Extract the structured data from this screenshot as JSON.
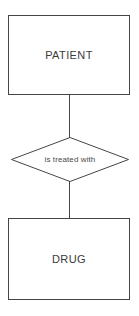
{
  "diagram": {
    "type": "entity-relationship-diagram",
    "entities": [
      {
        "id": "patient",
        "label": "PATIENT",
        "shape": "rectangle"
      },
      {
        "id": "drug",
        "label": "DRUG",
        "shape": "rectangle"
      }
    ],
    "relationship": {
      "id": "is-treated-with",
      "label": "is treated with",
      "shape": "diamond",
      "from": "PATIENT",
      "to": "DRUG"
    },
    "connectors": [
      {
        "id": "patient-to-relationship",
        "style": "solid-line"
      },
      {
        "id": "relationship-to-drug",
        "style": "solid-line"
      }
    ],
    "colors": {
      "background": "#ffffff",
      "stroke": "#454545",
      "text": "#3b3b3b",
      "relationship_text": "#4a4a4a"
    }
  }
}
